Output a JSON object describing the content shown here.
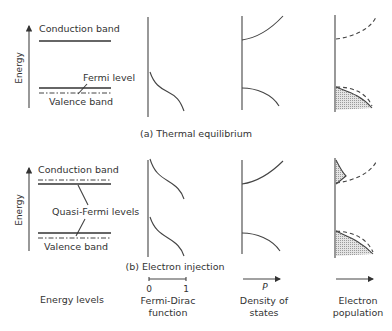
{
  "figure": {
    "panel_a": {
      "caption": "(a) Thermal equilibrium",
      "energy_axis_label": "Energy",
      "conduction_band_label": "Conduction band",
      "fermi_level_label": "Fermi level",
      "valence_band_label": "Valence band"
    },
    "panel_b": {
      "caption": "(b) Electron injection",
      "energy_axis_label": "Energy",
      "conduction_band_label": "Conduction band",
      "quasi_fermi_label": "Quasi-Fermi levels",
      "valence_band_label": "Valence band"
    },
    "columns": {
      "energy_levels": "Energy levels",
      "fermi_dirac_line1": "Fermi-Dirac",
      "fermi_dirac_line2": "function",
      "fermi_dirac_tick_0": "0",
      "fermi_dirac_tick_1": "1",
      "density_line1": "Density of",
      "density_line2": "states",
      "density_axis_symbol": "P",
      "population_line1": "Electron",
      "population_line2": "population"
    }
  }
}
